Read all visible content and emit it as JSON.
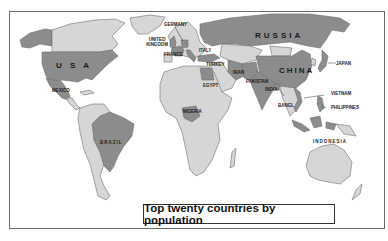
{
  "map": {
    "title": "Top twenty countries by population",
    "colors": {
      "ocean": "#ffffff",
      "highlighted_country": "#8c8c8c",
      "other_land": "#d6d6d6",
      "border": "#6e6e6e",
      "frame": "#6b6b6b"
    },
    "labels": {
      "usa": "U S A",
      "mexico": "MEXICO",
      "brazil": "BRAZIL",
      "germany": "GERMANY",
      "united_kingdom": "UNITED KINGDOM",
      "france": "FRANCE",
      "italy": "ITALY",
      "turkey": "TURKEY",
      "egypt": "EGYPT",
      "nigeria": "NIGERIA",
      "iran": "IRAN",
      "pakistan": "PAKISTAN",
      "india": "INDIA",
      "bangladesh": "BANGL",
      "russia": "RUSSIA",
      "china": "CHINA",
      "japan": "JAPAN",
      "vietnam": "VIETNAM",
      "philippines": "PHILIPPINES",
      "indonesia": "INDONESIA"
    }
  }
}
